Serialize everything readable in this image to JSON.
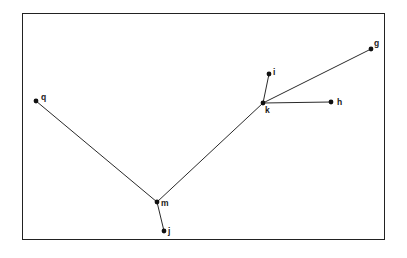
{
  "diagram": {
    "type": "tree",
    "nodes": [
      {
        "id": "q",
        "label": "q",
        "x": 36,
        "y": 101,
        "lx": 41,
        "ly": 100
      },
      {
        "id": "m",
        "label": "m",
        "x": 157,
        "y": 202,
        "lx": 161,
        "ly": 206
      },
      {
        "id": "j",
        "label": "j",
        "x": 164,
        "y": 231,
        "lx": 168,
        "ly": 234
      },
      {
        "id": "k",
        "label": "k",
        "x": 263,
        "y": 103,
        "lx": 265,
        "ly": 113
      },
      {
        "id": "i",
        "label": "i",
        "x": 269,
        "y": 74,
        "lx": 273,
        "ly": 75
      },
      {
        "id": "h",
        "label": "h",
        "x": 331,
        "y": 102,
        "lx": 337,
        "ly": 105
      },
      {
        "id": "g",
        "label": "g",
        "x": 371,
        "y": 49,
        "lx": 374,
        "ly": 46
      }
    ],
    "edges": [
      {
        "from": "q",
        "to": "m"
      },
      {
        "from": "m",
        "to": "j"
      },
      {
        "from": "m",
        "to": "k"
      },
      {
        "from": "k",
        "to": "i"
      },
      {
        "from": "k",
        "to": "h"
      },
      {
        "from": "k",
        "to": "g"
      }
    ],
    "colors": {
      "line": "#2a2a2a",
      "node": "#111111",
      "frame": "#222222",
      "background": "#ffffff"
    }
  }
}
